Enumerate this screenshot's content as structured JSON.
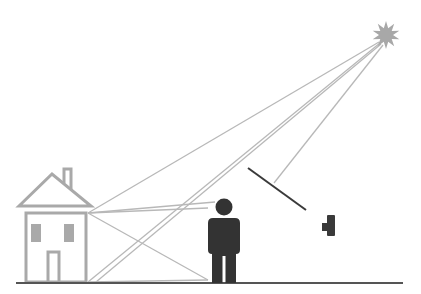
{
  "diagram": {
    "colors": {
      "background": "#ffffff",
      "ray": "#b8b8b8",
      "house": "#a9a9a9",
      "person": "#333333",
      "ground": "#555555",
      "mirror": "#3a3a3a",
      "sun": "#a8a8a8",
      "camera": "#3a3a3a"
    },
    "elements": {
      "sun": {
        "cx": 386,
        "cy": 35,
        "outer_r": 14,
        "inner_r": 7,
        "points": 10
      },
      "house": {
        "wall_x": 25,
        "wall_y": 213,
        "wall_w": 61,
        "wall_h": 69
      },
      "person": {
        "head_cx": 224,
        "head_cy": 207,
        "head_r": 8
      },
      "mirror": {
        "x1": 248,
        "y1": 168,
        "x2": 306,
        "y2": 210
      },
      "camera": {
        "x": 322,
        "y": 215
      },
      "ground": {
        "x1": 16,
        "y1": 283,
        "x2": 403,
        "y2": 283
      }
    },
    "rays": [
      {
        "x1": 379,
        "y1": 42,
        "x2": 88,
        "y2": 213
      },
      {
        "x1": 380,
        "y1": 43,
        "x2": 88,
        "y2": 282
      },
      {
        "x1": 381,
        "y1": 44,
        "x2": 96,
        "y2": 282
      },
      {
        "x1": 383,
        "y1": 45,
        "x2": 274,
        "y2": 183
      },
      {
        "x1": 88,
        "y1": 213,
        "x2": 215,
        "y2": 202
      },
      {
        "x1": 88,
        "y1": 213,
        "x2": 208,
        "y2": 208
      },
      {
        "x1": 88,
        "y1": 213,
        "x2": 208,
        "y2": 280
      },
      {
        "x1": 88,
        "y1": 282,
        "x2": 208,
        "y2": 280
      }
    ]
  }
}
